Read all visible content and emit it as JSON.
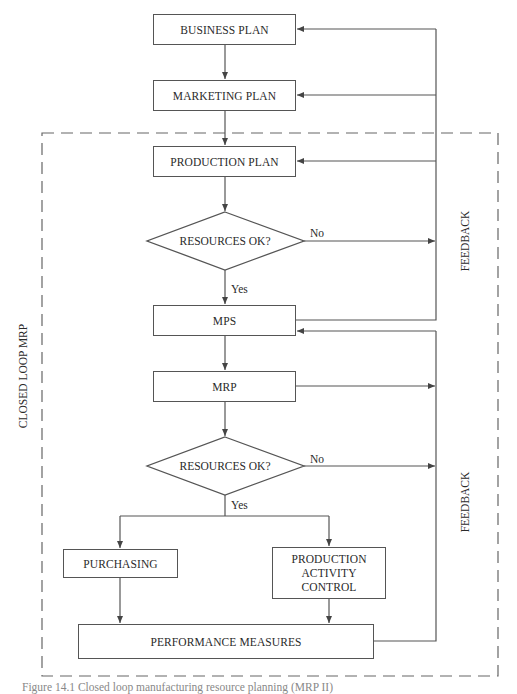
{
  "diagram": {
    "boundary_label": "CLOSED LOOP MRP",
    "feedback_labels": [
      "FEEDBACK",
      "FEEDBACK"
    ],
    "nodes": {
      "business_plan": "BUSINESS PLAN",
      "marketing_plan": "MARKETING PLAN",
      "production_plan": "PRODUCTION PLAN",
      "decision_1": "RESOURCES OK?",
      "mps": "MPS",
      "mrp": "MRP",
      "decision_2": "RESOURCES OK?",
      "purchasing": "PURCHASING",
      "production_activity_control": "PRODUCTION ACTIVITY CONTROL",
      "pac_lines": [
        "PRODUCTION",
        "ACTIVITY",
        "CONTROL"
      ],
      "performance_measures": "PERFORMANCE MEASURES"
    },
    "edge_labels": {
      "decision_1_no": "No",
      "decision_1_yes": "Yes",
      "decision_2_no": "No",
      "decision_2_yes": "Yes"
    },
    "colors": {
      "line": "#555555",
      "text": "#2a2a2a",
      "dashed_border": "#666666"
    }
  },
  "caption": "Figure 14.1 Closed loop manufacturing resource planning (MRP II)"
}
